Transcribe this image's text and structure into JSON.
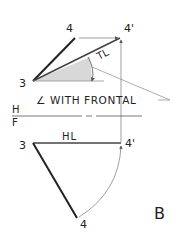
{
  "figure": {
    "panel_label": "B",
    "colors": {
      "ink": "#222222",
      "thin": "#777777",
      "shade": "#d8d8d8"
    },
    "top_view": {
      "point_3": "3",
      "point_4": "4",
      "point_4_prime": "4'",
      "true_length_label": "TL",
      "angle_callout": "∠ WITH FRONTAL"
    },
    "fold_line": {
      "upper": "H",
      "lower": "F"
    },
    "front_view": {
      "point_3": "3",
      "point_4": "4",
      "point_4_prime": "4'",
      "horizontal_line_label": "HL"
    }
  }
}
